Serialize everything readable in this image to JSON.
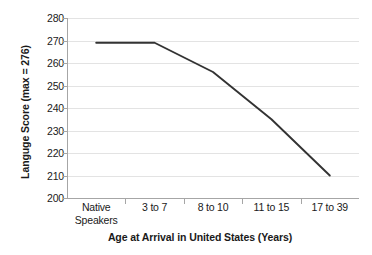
{
  "chart_data": {
    "type": "line",
    "title": "",
    "xlabel": "Age at Arrival in United States (Years)",
    "ylabel": "Languge Score (max = 276)",
    "categories": [
      "Native Speakers",
      "3 to 7",
      "8 to 10",
      "11 to 15",
      "17 to 39"
    ],
    "category_labels_wrapped": [
      [
        "Native",
        "Speakers"
      ],
      [
        "3 to 7"
      ],
      [
        "8 to 10"
      ],
      [
        "11 to 15"
      ],
      [
        "17 to 39"
      ]
    ],
    "series": [
      {
        "name": "Language Score",
        "values": [
          269,
          269,
          256,
          235,
          210
        ]
      }
    ],
    "ylim": [
      200,
      280
    ],
    "yticks": [
      280,
      270,
      260,
      250,
      240,
      230,
      220,
      210,
      200
    ],
    "ytick_labels": [
      "280",
      "270",
      "260",
      "250",
      "240",
      "230",
      "220",
      "210",
      "200"
    ],
    "grid": "horizontal",
    "legend": "none",
    "line_color": "#333333",
    "grid_color": "#e3e3e3",
    "axis_color": "#a6a6a6",
    "background": "#ffffff",
    "text_color": "#1a1a1a"
  }
}
